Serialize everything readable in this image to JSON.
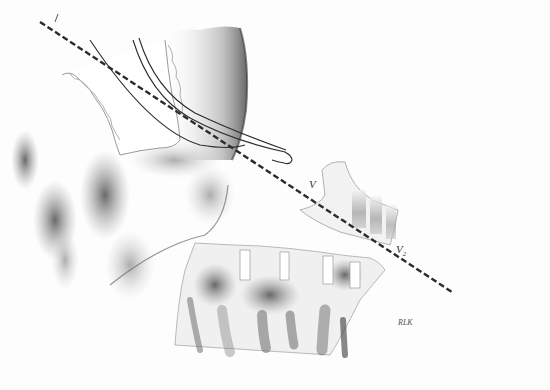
{
  "figure": {
    "labels": {
      "line_start_tick": "/",
      "v1": "V",
      "v2_main": "V",
      "v2_sub": "2",
      "artist_signature": "RLK"
    },
    "colors": {
      "background": "#fdfdfd",
      "ink": "#2b2b2b",
      "shade_dark": "#5a5a5a",
      "shade_mid": "#9a9a9a",
      "shade_light": "#cfcfcf"
    },
    "guide_line": {
      "style": "dashed",
      "from": [
        40,
        22
      ],
      "to": [
        452,
        292
      ]
    }
  }
}
